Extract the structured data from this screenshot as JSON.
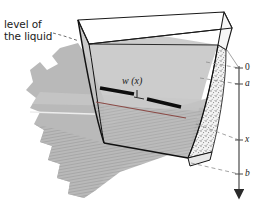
{
  "figure": {
    "type": "technical-illustration",
    "background_color": "#ffffff"
  },
  "annotations": {
    "level_of_liquid": {
      "line1": "level of",
      "line2": "the liquid",
      "leader": "dashed"
    },
    "strip_width_label": "w (x)"
  },
  "axis": {
    "name": "depth-axis",
    "orientation": "vertical-downward",
    "arrowhead": "down",
    "ticks": [
      {
        "id": "zero",
        "label": "0",
        "y": 68
      },
      {
        "id": "a",
        "label": "a",
        "y": 84
      },
      {
        "id": "x",
        "label": "x",
        "y": 140
      },
      {
        "id": "b",
        "label": "b",
        "y": 174
      }
    ]
  },
  "colors": {
    "ground_fill": "#b9b9b9",
    "liquid_surface": "#c6c6c6",
    "trough_wall_outline": "#111111",
    "stipple_wall": "#efefef",
    "strip_black": "#0d0d0d",
    "level_line_red": "#8a4a46",
    "axis_line": "#4a4a4a",
    "leader_dash": "#8c8c8c",
    "text": "#1a1a1a"
  },
  "geometry": {
    "trough_rim_top_left": [
      78,
      20
    ],
    "trough_rim_top_right": [
      218,
      45
    ],
    "trough_bottom_left": [
      104,
      143
    ],
    "trough_bottom_right": [
      188,
      158
    ],
    "strip_left_end": [
      100,
      88
    ],
    "strip_right_end": [
      172,
      108
    ]
  }
}
